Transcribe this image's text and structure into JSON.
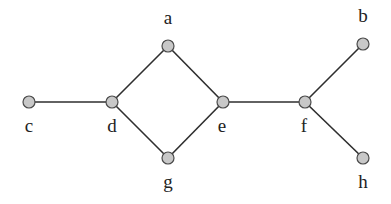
{
  "diagram": {
    "type": "undirected-graph",
    "nodes": [
      {
        "id": "a",
        "label": "a",
        "x": 168,
        "y": 46,
        "lx": 168,
        "ly": 24
      },
      {
        "id": "b",
        "label": "b",
        "x": 363,
        "y": 44,
        "lx": 363,
        "ly": 22
      },
      {
        "id": "c",
        "label": "c",
        "x": 29,
        "y": 102,
        "lx": 29,
        "ly": 132
      },
      {
        "id": "d",
        "label": "d",
        "x": 112,
        "y": 102,
        "lx": 112,
        "ly": 132
      },
      {
        "id": "e",
        "label": "e",
        "x": 223,
        "y": 102,
        "lx": 222,
        "ly": 132
      },
      {
        "id": "f",
        "label": "f",
        "x": 305,
        "y": 102,
        "lx": 304,
        "ly": 132
      },
      {
        "id": "g",
        "label": "g",
        "x": 168,
        "y": 158,
        "lx": 168,
        "ly": 188
      },
      {
        "id": "h",
        "label": "h",
        "x": 363,
        "y": 158,
        "lx": 363,
        "ly": 188
      }
    ],
    "edges": [
      [
        "c",
        "d"
      ],
      [
        "d",
        "a"
      ],
      [
        "d",
        "g"
      ],
      [
        "a",
        "e"
      ],
      [
        "g",
        "e"
      ],
      [
        "e",
        "f"
      ],
      [
        "f",
        "b"
      ],
      [
        "f",
        "h"
      ]
    ],
    "node_radius": 6,
    "colors": {
      "node_fill": "#c8c8c8",
      "node_stroke": "#4a4a4a",
      "edge": "#2e2e2e",
      "label": "#222222"
    }
  }
}
